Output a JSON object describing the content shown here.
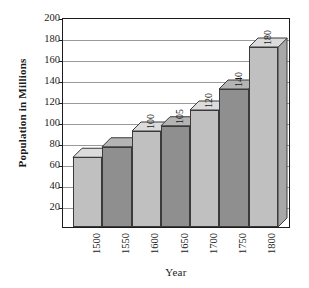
{
  "chart_data": {
    "type": "bar",
    "title": "",
    "xlabel": "Year",
    "ylabel": "Population in Millions",
    "categories": [
      "1500",
      "1550",
      "1600",
      "1650",
      "1700",
      "1750",
      "1800"
    ],
    "values": [
      75,
      85,
      100,
      105,
      120,
      140,
      180
    ],
    "data_labels": [
      "",
      "",
      "100",
      "105",
      "120",
      "140",
      "180"
    ],
    "ylim": [
      0,
      200
    ],
    "ytick_values": [
      20,
      40,
      60,
      80,
      100,
      120,
      140,
      160,
      180,
      200
    ],
    "ytick_labels": [
      "20",
      "40",
      "60",
      "80",
      "100",
      "120",
      "140",
      "160",
      "180",
      "200"
    ],
    "grid": true,
    "legend": "none",
    "style": "3d-column",
    "bar_colors": [
      "#c0c0c0",
      "#8f8f8f",
      "#c0c0c0",
      "#8f8f8f",
      "#c0c0c0",
      "#8f8f8f",
      "#c0c0c0"
    ],
    "bar_top_colors": [
      "#dcdcdc",
      "#b4b4b4",
      "#dcdcdc",
      "#b4b4b4",
      "#dcdcdc",
      "#b4b4b4",
      "#dcdcdc"
    ],
    "bar_side_colors": [
      "#a8a8a8",
      "#7a7a7a",
      "#a8a8a8",
      "#7a7a7a",
      "#a8a8a8",
      "#7a7a7a",
      "#a8a8a8"
    ],
    "axis_color": "#1c1c1c",
    "gridline_color": "#9a9a9a",
    "background_color": "#ffffff"
  }
}
